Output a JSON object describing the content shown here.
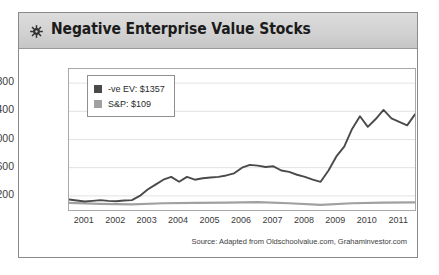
{
  "card": {
    "title": "Negative Enterprise Value Stocks",
    "gear_icon": "gear-icon",
    "source_note": "Source: Adapted from Oldschoolvalue.com, Grahaminvestor.com"
  },
  "colors": {
    "header_band": "#d4d4d4",
    "card_border": "#8a8a8a",
    "negative_ev_series": "#4a4a4a",
    "sp_series": "#a0a0a0",
    "gridline": "#e2e2e2",
    "plot_border": "#a8a8a8",
    "text": "#2b2b2b"
  },
  "chart_data": {
    "type": "line",
    "title": "Negative Enterprise Value Stocks",
    "xlabel": "",
    "ylabel": "",
    "grid": true,
    "legend_position": "top-left",
    "ylim": [
      0,
      2000
    ],
    "yticks": [
      200,
      600,
      1000,
      1400,
      1800
    ],
    "ytick_labels": [
      "$200",
      "$600",
      "$1,000",
      "$1,400",
      "$1,800"
    ],
    "xlim": [
      2001,
      2012
    ],
    "xticks": [
      2001,
      2002,
      2003,
      2004,
      2005,
      2006,
      2007,
      2008,
      2009,
      2010,
      2011
    ],
    "xtick_labels": [
      "2001",
      "2002",
      "2003",
      "2004",
      "2005",
      "2006",
      "2007",
      "2008",
      "2009",
      "2010",
      "2011"
    ],
    "series": [
      {
        "name": "-ve EV: $1357",
        "short_name": "-ve EV",
        "final_value": 1357,
        "color": "#4a4a4a",
        "x": [
          2001.0,
          2001.25,
          2001.5,
          2001.75,
          2002.0,
          2002.25,
          2002.5,
          2002.75,
          2003.0,
          2003.25,
          2003.5,
          2003.75,
          2004.0,
          2004.25,
          2004.5,
          2004.75,
          2005.0,
          2005.25,
          2005.5,
          2005.75,
          2006.0,
          2006.25,
          2006.5,
          2006.75,
          2007.0,
          2007.25,
          2007.5,
          2007.75,
          2008.0,
          2008.25,
          2008.5,
          2008.75,
          2009.0,
          2009.25,
          2009.5,
          2009.75,
          2010.0,
          2010.25,
          2010.5,
          2010.75,
          2011.0,
          2011.25,
          2011.5,
          2011.75,
          2012.0
        ],
        "y": [
          150,
          135,
          120,
          130,
          140,
          130,
          125,
          135,
          140,
          200,
          290,
          360,
          430,
          470,
          400,
          470,
          430,
          450,
          460,
          470,
          490,
          520,
          600,
          640,
          630,
          610,
          620,
          560,
          540,
          500,
          470,
          430,
          400,
          560,
          760,
          900,
          1150,
          1330,
          1180,
          1290,
          1420,
          1300,
          1250,
          1200,
          1357
        ]
      },
      {
        "name": "S&P: $109",
        "short_name": "S&P",
        "final_value": 109,
        "color": "#a0a0a0",
        "x": [
          2001.0,
          2002.0,
          2003.0,
          2004.0,
          2005.0,
          2006.0,
          2007.0,
          2008.0,
          2009.0,
          2010.0,
          2011.0,
          2012.0
        ],
        "y": [
          100,
          88,
          80,
          96,
          100,
          104,
          112,
          96,
          72,
          96,
          104,
          109
        ]
      }
    ]
  }
}
